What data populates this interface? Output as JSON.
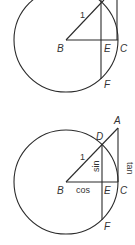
{
  "figures": [
    {
      "id": "top",
      "labels": {
        "B": "B",
        "E": "E",
        "C": "C",
        "F": "F",
        "radius": "1"
      }
    },
    {
      "id": "bottom",
      "labels": {
        "A": "A",
        "B": "B",
        "C": "C",
        "D": "D",
        "E": "E",
        "F": "F",
        "radius": "1",
        "sin": "sin",
        "cos": "cos",
        "tan": "tan"
      }
    }
  ],
  "colors": {
    "stroke": "#2b2b2b",
    "text": "#333333",
    "background": "#ffffff"
  }
}
